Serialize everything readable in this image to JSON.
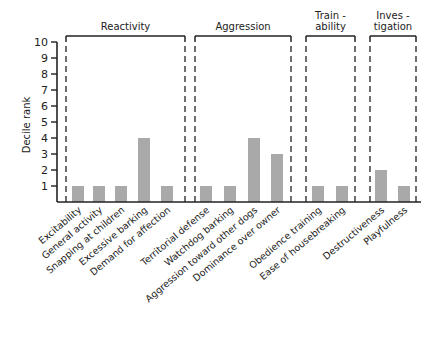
{
  "chart_data": {
    "type": "bar",
    "title": "",
    "xlabel": "",
    "ylabel": "Decile rank",
    "ylim": [
      0,
      10
    ],
    "yticks": [
      1,
      2,
      3,
      4,
      5,
      6,
      7,
      8,
      9,
      10
    ],
    "grid": false,
    "legend": null,
    "bar_color": "#a9a9a9",
    "categories": [
      "Excitability",
      "General activity",
      "Snapping at children",
      "Excessive barking",
      "Demand for affection",
      "Territorial defense",
      "Watchdog barking",
      "Aggression toward other dogs",
      "Dominance over owner",
      "Obedience training",
      "Ease of housebreaking",
      "Destructiveness",
      "Playfulness"
    ],
    "values": [
      1,
      1,
      1,
      4,
      1,
      1,
      1,
      4,
      3,
      1,
      1,
      2,
      1
    ],
    "groups": [
      {
        "label_lines": [
          "Reactivity"
        ],
        "categories": [
          "Excitability",
          "General activity",
          "Snapping at children",
          "Excessive barking",
          "Demand for affection"
        ]
      },
      {
        "label_lines": [
          "Aggression"
        ],
        "categories": [
          "Territorial defense",
          "Watchdog barking",
          "Aggression toward other dogs",
          "Dominance over owner"
        ]
      },
      {
        "label_lines": [
          "Train -",
          "ability"
        ],
        "categories": [
          "Obedience training",
          "Ease of housebreaking"
        ]
      },
      {
        "label_lines": [
          "Inves -",
          "tigation"
        ],
        "categories": [
          "Destructiveness",
          "Playfulness"
        ]
      }
    ]
  },
  "layout": {
    "axis_x": 57,
    "baseline_y": 202,
    "unit_px": 16,
    "axis_end_x": 421,
    "bar_width": 12,
    "bar_centers": [
      78,
      99,
      121,
      144,
      167,
      206,
      230,
      254,
      277,
      318,
      342,
      381,
      404
    ],
    "brackets": [
      {
        "x1": 66,
        "x2": 185
      },
      {
        "x1": 195,
        "x2": 291
      },
      {
        "x1": 306,
        "x2": 355
      },
      {
        "x1": 370,
        "x2": 416
      }
    ],
    "bracket_top": 36
  }
}
